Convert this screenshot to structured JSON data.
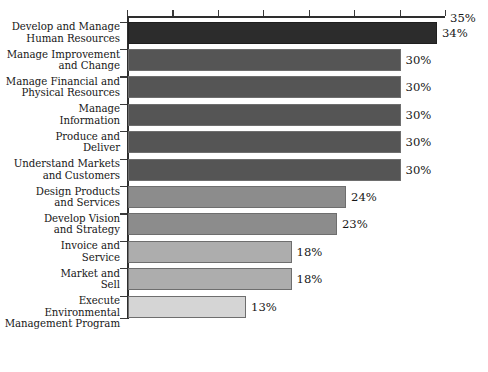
{
  "chart_data": {
    "type": "bar",
    "orientation": "horizontal",
    "title": "",
    "subtitle": "",
    "xlabel": "",
    "ylabel": "",
    "xlim": [
      0,
      35
    ],
    "grid": false,
    "legend": null,
    "axis_max_label": "35%",
    "tick_values": [
      0,
      5,
      10,
      15,
      20,
      25,
      30,
      35
    ],
    "categories": [
      "Develop and Manage Human Resources",
      "Manage Improvement and Change",
      "Manage Financial and Physical Resources",
      "Manage Information",
      "Produce and Deliver",
      "Understand Markets and Customers",
      "Design Products and Services",
      "Develop Vision and Strategy",
      "Invoice and Service",
      "Market and Sell",
      "Execute Environmental Management Program"
    ],
    "category_lines": [
      [
        "Develop and Manage",
        "Human Resources"
      ],
      [
        "Manage Improvement",
        "and Change"
      ],
      [
        "Manage Financial and",
        "Physical Resources"
      ],
      [
        "Manage",
        "Information"
      ],
      [
        "Produce and",
        "Deliver"
      ],
      [
        "Understand Markets",
        "and Customers"
      ],
      [
        "Design Products",
        "and Services"
      ],
      [
        "Develop Vision",
        "and Strategy"
      ],
      [
        "Invoice and",
        "Service"
      ],
      [
        "Market and",
        "Sell"
      ],
      [
        "Execute Environmental",
        "Management Program"
      ]
    ],
    "values": [
      34,
      30,
      30,
      30,
      30,
      30,
      24,
      23,
      18,
      18,
      13
    ],
    "value_labels": [
      "34%",
      "30%",
      "30%",
      "30%",
      "30%",
      "30%",
      "24%",
      "23%",
      "18%",
      "18%",
      "13%"
    ],
    "bar_colors": [
      "#2c2c2c",
      "#555555",
      "#555555",
      "#555555",
      "#555555",
      "#555555",
      "#8c8c8c",
      "#8c8c8c",
      "#adadad",
      "#adadad",
      "#d5d5d5"
    ]
  },
  "caption": ""
}
